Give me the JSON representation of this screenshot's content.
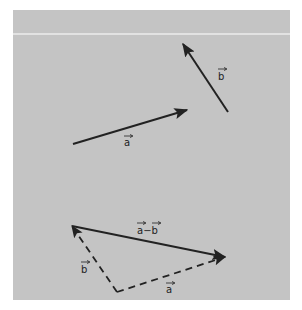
{
  "figure": {
    "background_color": "#c4c4c4",
    "rule_color": "#e2e2e2",
    "ink_color": "#222222"
  },
  "top_diagram": {
    "vector_a": {
      "label": "a",
      "from": [
        73,
        144
      ],
      "to": [
        187,
        110
      ]
    },
    "vector_b": {
      "label": "b",
      "from": [
        228,
        112
      ],
      "to": [
        183,
        44
      ]
    }
  },
  "bottom_diagram": {
    "difference": {
      "label": "a−b",
      "from": [
        225,
        257
      ],
      "to": [
        72,
        226
      ],
      "direction": "from tip of b to tip of a"
    },
    "dashed_b": {
      "label": "b",
      "from": [
        117,
        292
      ],
      "to": [
        72,
        226
      ],
      "style": "dashed"
    },
    "dashed_a": {
      "label": "a",
      "from": [
        117,
        292
      ],
      "to": [
        225,
        257
      ],
      "style": "dashed"
    }
  },
  "labels": {
    "a_top": "a",
    "b_top": "b",
    "diff": "a−b",
    "b_bottom": "b",
    "a_bottom": "a"
  }
}
